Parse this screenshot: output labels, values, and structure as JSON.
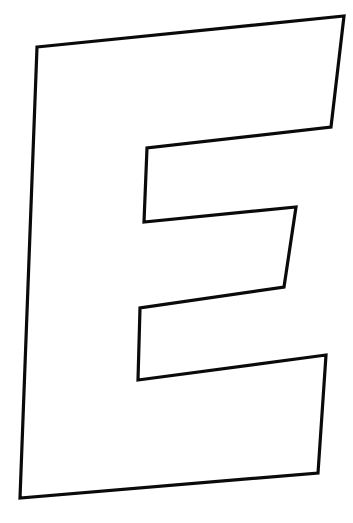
{
  "image": {
    "subject": "Outlined block capital letter E",
    "letter": "E",
    "style": "outline",
    "colors": {
      "background": "#ffffff",
      "stroke": "#0a0a0a",
      "fill": "#ffffff"
    }
  }
}
